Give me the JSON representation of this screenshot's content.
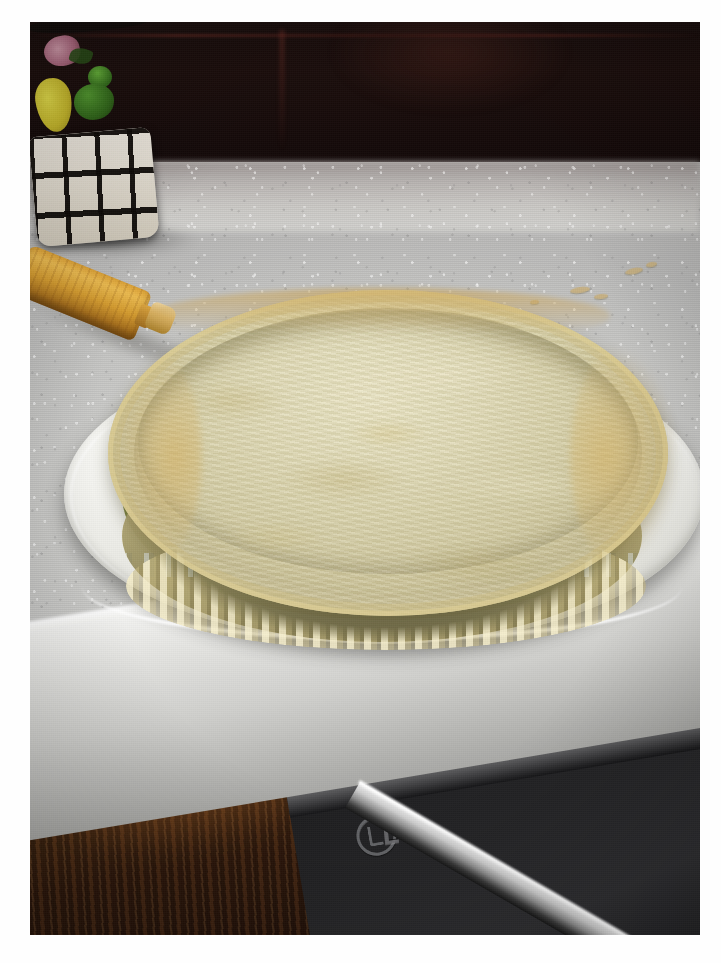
{
  "image": {
    "kind": "photograph",
    "subject": "Baked pie crust / tart shell in a fluted pan on a green plate",
    "orientation": "portrait",
    "border": {
      "color": "#ffffff",
      "left_px": 30,
      "top_px": 22,
      "right_px": 21,
      "bottom_px": 28
    }
  },
  "scene": {
    "background": {
      "name": "dark-kitchen-wall",
      "color": "#120a0a",
      "description": "Dark shadowed backsplash / wall across the top of the frame"
    },
    "countertop": {
      "name": "speckled-white-countertop",
      "color": "#d4d4d1",
      "description": "Speckled white-grey granite style countertop"
    },
    "cabinet": {
      "name": "dark-wood-cabinet",
      "color": "#3a1d0d",
      "description": "Dark stained wood cabinet door below the counter edge"
    },
    "appliance": {
      "name": "lg-appliance",
      "brand": "LG",
      "color": "#242426",
      "description": "Dark LG appliance (dishwasher) front with chrome handle"
    }
  },
  "objects": [
    {
      "name": "pie-crust",
      "label": "Baked pie crust",
      "colors": {
        "interior": "#ddd6ab",
        "rim_highlight": "#f4ecc8",
        "browned": "#d4b060"
      },
      "details": "Pale golden blind-baked pastry shell with a crimped fluted edge and mottled blistered surface"
    },
    {
      "name": "tart-pan",
      "label": "Fluted tart pan",
      "colors": {
        "side": "#cbbd84"
      },
      "details": "Scalloped vertical fluting visible around the lower side of the shell"
    },
    {
      "name": "serving-plate",
      "label": "Green plate",
      "colors": {
        "well": "#9aa254",
        "rim": "#f7f7f3"
      },
      "details": "Olive / sage green plate with a wide white rim"
    },
    {
      "name": "rolling-pin",
      "label": "Wooden rolling pin",
      "colors": {
        "body": "#d8a33c",
        "handle": "#dcb66a"
      },
      "details": "Light wood rolling pin lying diagonally behind the plate"
    },
    {
      "name": "fruit-basket",
      "label": "White lattice basket with fruit",
      "colors": {
        "basket": "#e6e1d5",
        "pear": "#d9d23a",
        "grapes": "#3f8a24",
        "flower": "#c98ba2"
      },
      "details": "White wicker-lattice canister holding decorative fruit and flowers in the dark upper-left corner"
    },
    {
      "name": "crumbs",
      "label": "Pastry crumbs",
      "color": "#c6b184",
      "details": "A few small pastry crumbs scattered on the countertop to the right of the plate"
    }
  ],
  "branding": {
    "appliance_logo_text": "LG"
  },
  "crumbs": [
    {
      "x": 570,
      "y": 287,
      "w": 20,
      "h": 6,
      "r": -8
    },
    {
      "x": 594,
      "y": 294,
      "w": 14,
      "h": 5,
      "r": -6
    },
    {
      "x": 625,
      "y": 268,
      "w": 18,
      "h": 6,
      "r": -12
    },
    {
      "x": 646,
      "y": 262,
      "w": 11,
      "h": 5,
      "r": -10
    },
    {
      "x": 530,
      "y": 300,
      "w": 9,
      "h": 4,
      "r": -5
    }
  ]
}
